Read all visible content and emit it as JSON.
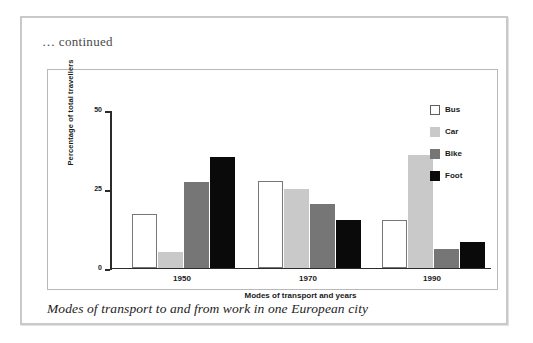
{
  "page": {
    "continued_note": "… continued"
  },
  "figure": {
    "caption": "Modes of transport to and from work in one European city"
  },
  "legend": {
    "position": "top-right",
    "items": [
      {
        "label": "Bus",
        "color": "#ffffff",
        "key": "bus"
      },
      {
        "label": "Car",
        "color": "#c9c9c9",
        "key": "car"
      },
      {
        "label": "Bike",
        "color": "#767676",
        "key": "bike"
      },
      {
        "label": "Foot",
        "color": "#0a0a0a",
        "key": "foot"
      }
    ]
  },
  "axes": {
    "y_title": "Percentage of total travellers",
    "x_title": "Modes of transport and years",
    "y_ticks": [
      "0",
      "25",
      "50"
    ],
    "x_ticks": [
      "1950",
      "1970",
      "1990"
    ]
  },
  "chart_data": {
    "type": "bar",
    "title": "Modes of transport to and from work in one European city",
    "xlabel": "Modes of transport and years",
    "ylabel": "Percentage of total travellers",
    "categories": [
      "1950",
      "1970",
      "1990"
    ],
    "series": [
      {
        "name": "Bus",
        "color": "#ffffff",
        "values": [
          17,
          27.5,
          15
        ]
      },
      {
        "name": "Car",
        "color": "#c9c9c9",
        "values": [
          5,
          25,
          35.5
        ]
      },
      {
        "name": "Bike",
        "color": "#767676",
        "values": [
          27,
          20,
          6
        ]
      },
      {
        "name": "Foot",
        "color": "#0a0a0a",
        "values": [
          35,
          15,
          8
        ]
      }
    ],
    "ylim": [
      0,
      50
    ],
    "yticks": [
      0,
      25,
      50
    ],
    "grid": false,
    "legend": true,
    "legend_position": "upper right"
  }
}
